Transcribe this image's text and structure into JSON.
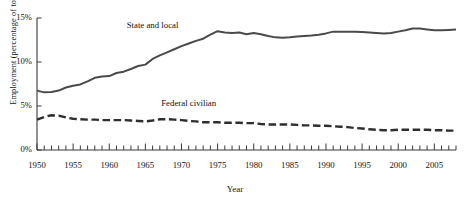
{
  "chart_data": {
    "type": "line",
    "title": "",
    "xlabel": "Year",
    "ylabel": "Employment (percentage of total)",
    "xlim": [
      1950,
      2008
    ],
    "ylim": [
      0,
      15
    ],
    "grid": false,
    "legend_position": "inline-annotation",
    "y_tick_labels": [
      "0%",
      "5%",
      "10%",
      "15%"
    ],
    "y_tick_values": [
      0,
      5,
      10,
      15
    ],
    "x_tick_labels": [
      "1950",
      "1955",
      "1960",
      "1965",
      "1970",
      "1975",
      "1980",
      "1985",
      "1990",
      "1995",
      "2000",
      "2005"
    ],
    "x_tick_values": [
      1950,
      1955,
      1960,
      1965,
      1970,
      1975,
      1980,
      1985,
      1990,
      1995,
      2000,
      2005
    ],
    "x_minor_tick_step": 1,
    "x": [
      1950,
      1951,
      1952,
      1953,
      1954,
      1955,
      1956,
      1957,
      1958,
      1959,
      1960,
      1961,
      1962,
      1963,
      1964,
      1965,
      1966,
      1967,
      1968,
      1969,
      1970,
      1971,
      1972,
      1973,
      1974,
      1975,
      1976,
      1977,
      1978,
      1979,
      1980,
      1981,
      1982,
      1983,
      1984,
      1985,
      1986,
      1987,
      1988,
      1989,
      1990,
      1991,
      1992,
      1993,
      1994,
      1995,
      1996,
      1997,
      1998,
      1999,
      2000,
      2001,
      2002,
      2003,
      2004,
      2005,
      2006,
      2007,
      2008
    ],
    "series": [
      {
        "name": "State and local",
        "style": "solid",
        "color": "#4a4a4a",
        "values": [
          6.75,
          6.55,
          6.6,
          6.75,
          7.1,
          7.3,
          7.45,
          7.8,
          8.2,
          8.35,
          8.4,
          8.75,
          8.9,
          9.2,
          9.55,
          9.7,
          10.35,
          10.75,
          11.1,
          11.45,
          11.8,
          12.1,
          12.4,
          12.65,
          13.1,
          13.5,
          13.35,
          13.3,
          13.35,
          13.15,
          13.3,
          13.15,
          12.95,
          12.8,
          12.75,
          12.8,
          12.9,
          12.95,
          13.0,
          13.1,
          13.25,
          13.45,
          13.45,
          13.45,
          13.45,
          13.4,
          13.35,
          13.3,
          13.25,
          13.3,
          13.45,
          13.6,
          13.8,
          13.8,
          13.7,
          13.6,
          13.6,
          13.65,
          13.7
        ]
      },
      {
        "name": "Federal civilian",
        "style": "dashed",
        "color": "#2e2e2e",
        "values": [
          3.45,
          3.75,
          3.95,
          3.9,
          3.7,
          3.55,
          3.5,
          3.45,
          3.45,
          3.4,
          3.4,
          3.4,
          3.4,
          3.35,
          3.3,
          3.25,
          3.35,
          3.5,
          3.5,
          3.45,
          3.4,
          3.3,
          3.25,
          3.15,
          3.15,
          3.15,
          3.1,
          3.1,
          3.1,
          3.05,
          3.05,
          2.95,
          2.9,
          2.9,
          2.9,
          2.9,
          2.85,
          2.8,
          2.8,
          2.75,
          2.75,
          2.7,
          2.65,
          2.6,
          2.5,
          2.45,
          2.35,
          2.3,
          2.25,
          2.25,
          2.3,
          2.3,
          2.3,
          2.3,
          2.3,
          2.25,
          2.25,
          2.2,
          2.2
        ]
      }
    ],
    "annotations": [
      {
        "text": "State and local",
        "x": 1966,
        "y": 14.1
      },
      {
        "text": "Federal civilian",
        "x": 1971,
        "y": 5.2
      }
    ]
  },
  "axis": {
    "axis_color": "#3a3a3a"
  }
}
